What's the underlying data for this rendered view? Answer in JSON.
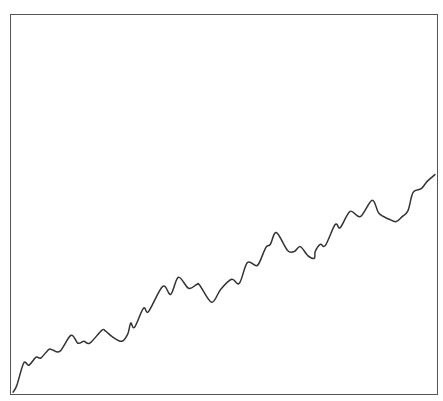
{
  "chart_data": {
    "type": "line",
    "title": "",
    "xlabel": "",
    "ylabel": "",
    "grid": false,
    "legend": null,
    "xlim": [
      0,
      100
    ],
    "ylim": [
      0,
      100
    ],
    "series": [
      {
        "name": "",
        "color": "#333333",
        "x": [
          0.5,
          1.4,
          3.0,
          4.2,
          5.9,
          7.0,
          8.9,
          9.8,
          11.5,
          14.1,
          15.7,
          17.1,
          18.5,
          21.3,
          22.2,
          23.9,
          26.0,
          27.4,
          28.1,
          29.0,
          31.1,
          32.3,
          35.6,
          37.5,
          39.3,
          41.7,
          43.6,
          44.3,
          47.1,
          49.2,
          51.8,
          53.6,
          55.5,
          57.8,
          59.3,
          60.0,
          60.9,
          62.3,
          64.9,
          66.5,
          67.9,
          69.6,
          71.2,
          71.4,
          72.6,
          73.8,
          76.1,
          77.3,
          79.6,
          82.0,
          84.8,
          86.4,
          88.8,
          90.4,
          91.8,
          93.2,
          94.4,
          96.3,
          97.7,
          99.5
        ],
        "y": [
          0.5,
          2.4,
          8.2,
          7.6,
          9.7,
          9.5,
          11.8,
          11.6,
          11.3,
          15.5,
          13.4,
          13.9,
          13.4,
          16.8,
          16.6,
          15.0,
          13.9,
          15.8,
          18.7,
          17.6,
          22.6,
          21.8,
          28.4,
          26.3,
          30.8,
          27.9,
          28.9,
          28.7,
          24.2,
          27.6,
          30.3,
          29.2,
          34.7,
          33.9,
          37.4,
          38.9,
          39.5,
          42.6,
          37.9,
          37.6,
          38.9,
          36.6,
          35.8,
          37.6,
          39.5,
          39.2,
          44.7,
          43.9,
          48.2,
          46.8,
          51.1,
          47.6,
          46.1,
          45.5,
          46.8,
          48.4,
          53.2,
          54.2,
          56.1,
          57.9
        ]
      }
    ]
  }
}
